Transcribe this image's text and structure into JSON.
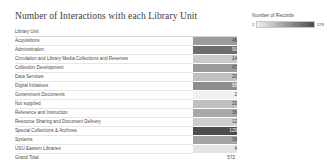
{
  "title": "Number of Interactions with each Library Unit",
  "table": {
    "header_label": "Library Unit",
    "total_label": "Grand Total",
    "total_value": "572"
  },
  "legend": {
    "title": "Number of Records",
    "min": "2",
    "max": "129",
    "color_low": "#f0f0f0",
    "color_high": "#4d4d4d"
  },
  "chart_data": {
    "type": "heatmap",
    "title": "Number of Interactions with each Library Unit",
    "xlabel": "",
    "ylabel": "Library Unit",
    "legend_title": "Number of Records",
    "legend_position": "top-right",
    "grid": false,
    "color_scale": {
      "min": 2,
      "max": 129,
      "low_color": "#f0f0f0",
      "high_color": "#4d4d4d"
    },
    "categories": [
      "Acquisitions",
      "Administration",
      "Circulation and Library Media Collections and Reserves",
      "Collection Development",
      "Data Services",
      "Digital Initiatives",
      "Government Documents",
      "Not supplied",
      "Reference and Instruction",
      "Resource Sharing and Document Delivery",
      "Special Collections & Archives",
      "Systems",
      "USU Eastern Libraries"
    ],
    "values": [
      46,
      91,
      14,
      47,
      20,
      58,
      2,
      20,
      36,
      12,
      129,
      38,
      4
    ],
    "total": 572,
    "rows": [
      {
        "label": "Acquisitions",
        "value": "46"
      },
      {
        "label": "Administration",
        "value": "91"
      },
      {
        "label": "Circulation and Library Media Collections and Reserves",
        "value": "14"
      },
      {
        "label": "Collection Development",
        "value": "47"
      },
      {
        "label": "Data Services",
        "value": "20"
      },
      {
        "label": "Digital Initiatives",
        "value": "58"
      },
      {
        "label": "Government Documents",
        "value": "2"
      },
      {
        "label": "Not supplied",
        "value": "20"
      },
      {
        "label": "Reference and Instruction",
        "value": "36"
      },
      {
        "label": "Resource Sharing and Document Delivery",
        "value": "12"
      },
      {
        "label": "Special Collections & Archives",
        "value": "129"
      },
      {
        "label": "Systems",
        "value": "38"
      },
      {
        "label": "USU Eastern Libraries",
        "value": "4"
      }
    ]
  }
}
